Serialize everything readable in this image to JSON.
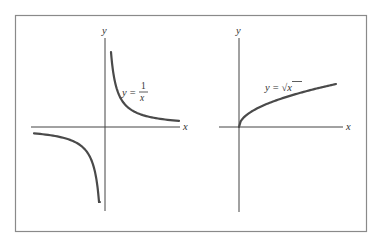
{
  "figure": {
    "panels": [
      {
        "id": "reciprocal",
        "function": "y = 1/x",
        "label": {
          "lhs": "y",
          "eq": "=",
          "numerator": "1",
          "denominator": "x"
        },
        "axis_labels": {
          "x": "x",
          "y": "y"
        }
      },
      {
        "id": "sqrt",
        "function": "y = sqrt(x)",
        "label": {
          "lhs": "y",
          "eq": "=",
          "radical": "√",
          "radicand": "x"
        },
        "axis_labels": {
          "x": "x",
          "y": "y"
        }
      }
    ]
  }
}
